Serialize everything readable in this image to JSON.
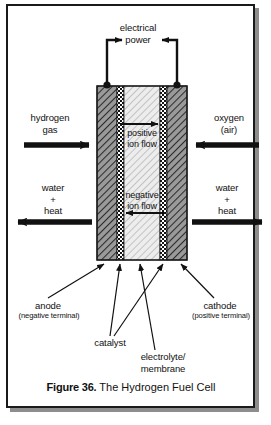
{
  "figure": {
    "caption_bold": "Figure 36.",
    "caption_rest": " The Hydrogen Fuel Cell",
    "title": "The Hydrogen Fuel Cell"
  },
  "diagram": {
    "type": "schematic",
    "labels": {
      "electrical_power": "electrical\npower",
      "hydrogen_gas": "hydrogen\ngas",
      "oxygen_air": "oxygen\n(air)",
      "water_heat_left": "water\n+\nheat",
      "water_heat_right": "water\n+\nheat",
      "positive_ion_flow": "positive\nion flow",
      "negative_ion_flow": "negative\nion flow",
      "anode": "anode",
      "anode_sub": "(negative terminal)",
      "cathode": "cathode",
      "cathode_sub": "(positive terminal)",
      "catalyst": "catalyst",
      "electrolyte": "electrolyte/\nmembrane"
    },
    "layers": [
      {
        "name": "anode-electrode",
        "fill": "dark-diagonal-hatch"
      },
      {
        "name": "anode-catalyst",
        "fill": "checkerboard"
      },
      {
        "name": "electrolyte-membrane",
        "fill": "light-diagonal-hatch"
      },
      {
        "name": "cathode-catalyst",
        "fill": "checkerboard"
      },
      {
        "name": "cathode-electrode",
        "fill": "dark-diagonal-hatch"
      }
    ],
    "flows": [
      {
        "name": "hydrogen-in",
        "direction": "right"
      },
      {
        "name": "oxygen-in",
        "direction": "left"
      },
      {
        "name": "water-heat-out-left",
        "direction": "left"
      },
      {
        "name": "water-heat-out-right",
        "direction": "right"
      },
      {
        "name": "positive-ion-flow",
        "direction": "right"
      },
      {
        "name": "negative-ion-flow",
        "direction": "left"
      }
    ],
    "colors": {
      "ink": "#111111",
      "electrode": "#8e8e8e",
      "electrolyte": "#e2e2e2",
      "frame": "#1a1a1a",
      "shadow": "#8d8d8d"
    }
  }
}
